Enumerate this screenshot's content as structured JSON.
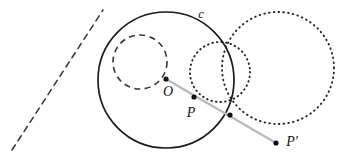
{
  "figure": {
    "width": 343,
    "height": 156,
    "background_color": "#ffffff"
  },
  "labels": {
    "circle_c": "c",
    "center_o": "O",
    "point_p": "P",
    "point_p_prime": "P′"
  },
  "colors": {
    "stroke_solid": "#1a1a1a",
    "stroke_dashed": "#333333",
    "stroke_dotted": "#222222",
    "ray": "#b9b9b9",
    "point_fill": "#111111",
    "background": "#ffffff"
  },
  "geometry": {
    "main_circle": {
      "name": "c",
      "cx": 166,
      "cy": 80,
      "r": 68,
      "style": "solid"
    },
    "dashed_circle": {
      "cx": 140,
      "cy": 62,
      "r": 27,
      "style": "dashed"
    },
    "small_dotted_circle": {
      "cx": 220,
      "cy": 72,
      "r": 30,
      "style": "dotted"
    },
    "large_dotted_circle": {
      "cx": 278,
      "cy": 68,
      "r": 56,
      "style": "dotted"
    },
    "dashed_line": {
      "x1": 12,
      "y1": 150,
      "x2": 103,
      "y2": 10,
      "style": "dashed"
    },
    "ray": {
      "x1": 166,
      "y1": 79,
      "x2": 276,
      "y2": 143,
      "style": "solid-gray"
    },
    "points": [
      {
        "name": "O",
        "x": 166,
        "y": 79,
        "label_x": 168,
        "label_y": 96
      },
      {
        "name": "P",
        "x": 194,
        "y": 97,
        "label_x": 189,
        "label_y": 116
      },
      {
        "name": "intersection",
        "x": 230,
        "y": 115,
        "label_x": null,
        "label_y": null
      },
      {
        "name": "P-prime",
        "x": 276,
        "y": 143,
        "label_x": 284,
        "label_y": 145
      }
    ],
    "label_c": {
      "x": 201,
      "y": 18
    }
  }
}
